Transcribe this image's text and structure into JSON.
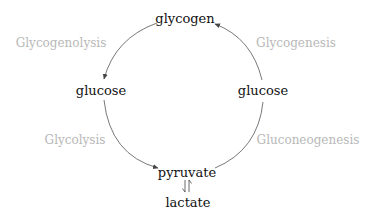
{
  "diagram": {
    "title": "",
    "nodes": {
      "glycogen": "glycogen",
      "glucose_left": "glucose",
      "glucose_right": "glucose",
      "pyruvate": "pyruvate",
      "lactate": "lactate"
    },
    "processes": {
      "glycogenolysis": "Glycogenolysis",
      "glycogenesis": "Glycogenesis",
      "glycolysis": "Glycolysis",
      "gluconeogenesis": "Gluconeogenesis"
    },
    "edges": [
      {
        "from": "glycogen",
        "to": "glucose_left",
        "label": "Glycogenolysis"
      },
      {
        "from": "glucose_left",
        "to": "pyruvate",
        "label": "Glycolysis"
      },
      {
        "from": "pyruvate",
        "to": "glucose_right",
        "label": "Gluconeogenesis"
      },
      {
        "from": "glucose_right",
        "to": "glycogen",
        "label": "Glycogenesis"
      },
      {
        "from": "pyruvate",
        "to": "lactate",
        "label": "",
        "type": "equilibrium"
      }
    ],
    "colors": {
      "node_text": "#111111",
      "process_text": "#b8b8b8",
      "arrow": "#444444"
    }
  }
}
